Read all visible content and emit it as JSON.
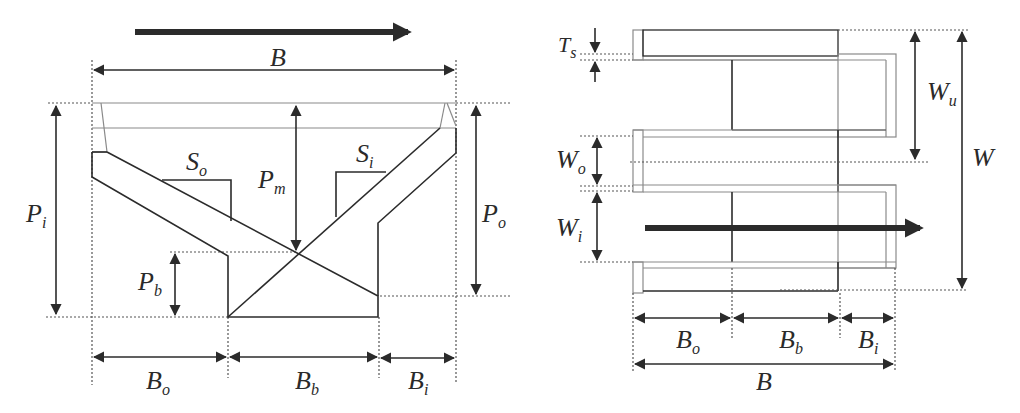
{
  "figure": {
    "left_view": {
      "name": "cross-section",
      "labels": {
        "B": {
          "main": "B",
          "sub": ""
        },
        "Pi": {
          "main": "P",
          "sub": "i"
        },
        "Po": {
          "main": "P",
          "sub": "o"
        },
        "Pm": {
          "main": "P",
          "sub": "m"
        },
        "Pb": {
          "main": "P",
          "sub": "b"
        },
        "So": {
          "main": "S",
          "sub": "o"
        },
        "Si": {
          "main": "S",
          "sub": "i"
        },
        "Bo": {
          "main": "B",
          "sub": "o"
        },
        "Bb": {
          "main": "B",
          "sub": "b"
        },
        "Bi": {
          "main": "B",
          "sub": "i"
        }
      },
      "flow_arrow": "right"
    },
    "right_view": {
      "name": "plan-view",
      "labels": {
        "Ts": {
          "main": "T",
          "sub": "s"
        },
        "Wu": {
          "main": "W",
          "sub": "u"
        },
        "W": {
          "main": "W",
          "sub": ""
        },
        "Wo": {
          "main": "W",
          "sub": "o"
        },
        "Wi": {
          "main": "W",
          "sub": "i"
        },
        "Bo": {
          "main": "B",
          "sub": "o"
        },
        "Bb": {
          "main": "B",
          "sub": "b"
        },
        "Bi": {
          "main": "B",
          "sub": "i"
        },
        "B": {
          "main": "B",
          "sub": ""
        }
      },
      "flow_arrow": "right"
    },
    "colors": {
      "line": "#2b2b2b",
      "thin_line": "#8a8a8a",
      "background": "#ffffff"
    }
  }
}
